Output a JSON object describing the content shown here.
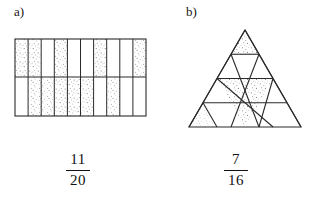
{
  "page": {
    "background_color": "#ffffff",
    "ink_color": "#2a2a2a",
    "shade_color": "#8d8d8d"
  },
  "parts": [
    {
      "id": "a",
      "label": "a)",
      "figure": {
        "kind": "rectangle-grid",
        "columns": 10,
        "rows": 2,
        "total_cells": 20,
        "shaded_count": 11,
        "width": 131,
        "height": 78,
        "shaded_cells": [
          {
            "row": 0,
            "col": 0
          },
          {
            "row": 0,
            "col": 1
          },
          {
            "row": 0,
            "col": 3
          },
          {
            "row": 0,
            "col": 6
          },
          {
            "row": 1,
            "col": 1
          },
          {
            "row": 1,
            "col": 3
          },
          {
            "row": 1,
            "col": 4
          },
          {
            "row": 1,
            "col": 5
          },
          {
            "row": 1,
            "col": 7
          },
          {
            "row": 1,
            "col": 2
          },
          {
            "row": 0,
            "col": 9
          }
        ]
      },
      "fraction": {
        "numerator": "11",
        "denominator": "20"
      }
    },
    {
      "id": "b",
      "label": "b)",
      "figure": {
        "kind": "triangle-grid",
        "rows": 4,
        "total_triangles": 16,
        "shaded_count": 7,
        "side": 112,
        "height": 97,
        "shaded_triangles": [
          {
            "row": 0,
            "index": 0,
            "orientation": "up"
          },
          {
            "row": 2,
            "index": 1,
            "orientation": "down"
          },
          {
            "row": 2,
            "index": 2,
            "orientation": "up"
          },
          {
            "row": 3,
            "index": 2,
            "orientation": "up"
          },
          {
            "row": 3,
            "index": 3,
            "orientation": "down"
          },
          {
            "row": 3,
            "index": 4,
            "orientation": "up"
          },
          {
            "row": 3,
            "index": 0,
            "orientation": "up"
          }
        ]
      },
      "fraction": {
        "numerator": "7",
        "denominator": "16"
      }
    }
  ]
}
